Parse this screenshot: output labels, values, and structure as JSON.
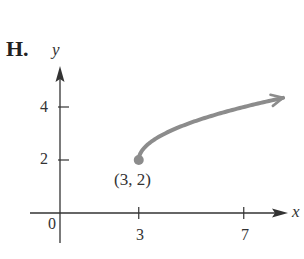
{
  "panel": {
    "label": "H."
  },
  "chart_data": {
    "type": "line",
    "title": "",
    "xlabel": "x",
    "ylabel": "y",
    "function": "y = sqrt(x - 3) + 2",
    "x": [
      3,
      3.25,
      3.5,
      4,
      4.5,
      5,
      5.5,
      6,
      6.5,
      7,
      7.5,
      8,
      8.5
    ],
    "y": [
      2,
      2.5,
      2.71,
      3,
      3.22,
      3.41,
      3.58,
      3.73,
      3.87,
      4,
      4.12,
      4.24,
      4.35
    ],
    "start_point": {
      "x": 3,
      "y": 2,
      "label": "(3, 2)",
      "closed": true
    },
    "end_arrow": true,
    "x_ticks": [
      3,
      7
    ],
    "x_tick_labels": [
      "3",
      "7"
    ],
    "y_ticks": [
      2,
      4
    ],
    "y_tick_labels": [
      "2",
      "4"
    ],
    "origin_label": "0",
    "xlim": [
      -1.1,
      8.6
    ],
    "ylim": [
      -1.1,
      5.5
    ],
    "grid": false,
    "colors": {
      "curve": "#8c8c8c",
      "axes": "#333333"
    }
  }
}
